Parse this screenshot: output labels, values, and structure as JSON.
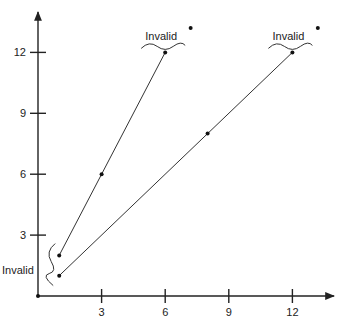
{
  "chart_data": {
    "type": "line",
    "title": "",
    "xlabel": "",
    "ylabel": "",
    "xlim": [
      0,
      14
    ],
    "ylim": [
      0,
      14
    ],
    "x_ticks": [
      3,
      6,
      9,
      12
    ],
    "y_ticks": [
      3,
      6,
      9,
      12
    ],
    "x_tick_labels": [
      "3",
      "6",
      "9",
      "12"
    ],
    "y_tick_labels": [
      "3",
      "6",
      "9",
      "12"
    ],
    "grid": false,
    "series": [
      {
        "name": "line-a",
        "points": [
          [
            1,
            2
          ],
          [
            3,
            6
          ],
          [
            6,
            12
          ]
        ]
      },
      {
        "name": "line-b",
        "points": [
          [
            1,
            1
          ],
          [
            8,
            8
          ],
          [
            12,
            12
          ]
        ]
      }
    ],
    "isolated_points": [
      [
        7.2,
        13.2
      ],
      [
        13.2,
        13.2
      ]
    ],
    "annotations": [
      {
        "text": "Invalid",
        "anchor": [
          6,
          12
        ],
        "brace": "under",
        "position": "above"
      },
      {
        "text": "Invalid",
        "anchor": [
          12,
          12
        ],
        "brace": "under",
        "position": "above"
      },
      {
        "text": "Invalid",
        "anchor": [
          1,
          1.5
        ],
        "brace": "left",
        "position": "left"
      }
    ]
  }
}
